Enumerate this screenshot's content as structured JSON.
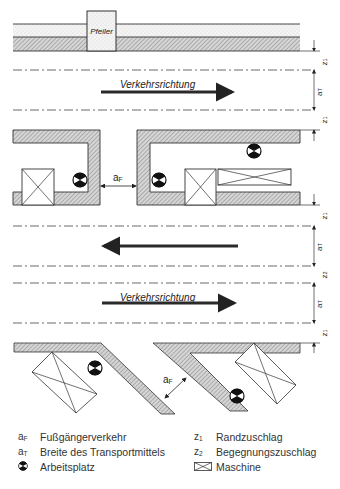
{
  "diagram": {
    "pillar_label": "Pfeiler",
    "direction_label_top": "Verkehrsrichtung",
    "direction_label_bottom": "Verkehrsrichtung",
    "gap_label_af": "a",
    "gap_label_af_sub": "F",
    "dim_labels": {
      "z1": "z",
      "z1_sub": "1",
      "z2": "z",
      "z2_sub": "2",
      "aT": "a",
      "aT_sub": "T"
    },
    "colors": {
      "line": "#333333",
      "hatch": "#9a9a9a",
      "arrow": "#2a2a2a",
      "background": "#ffffff"
    }
  },
  "legend": {
    "items": [
      {
        "symbol": "a",
        "sub": "F",
        "label": "Fußgängerverkehr"
      },
      {
        "symbol": "a",
        "sub": "T",
        "label": "Breite des Transportmittels"
      },
      {
        "symbol_icon": "workplace-icon",
        "label": "Arbeitsplatz"
      },
      {
        "symbol": "z",
        "sub": "1",
        "label": "Randzuschlag"
      },
      {
        "symbol": "z",
        "sub": "2",
        "label": "Begegnungszuschlag"
      },
      {
        "symbol_icon": "machine-icon",
        "label": "Maschine"
      }
    ]
  }
}
